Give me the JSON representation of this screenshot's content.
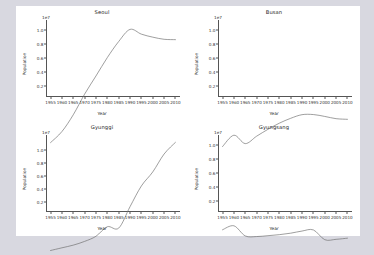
{
  "figure": {
    "background": "#d8d8e0",
    "axes_background": "#ffffff",
    "line_color": "#6b6b6b"
  },
  "chart_data": [
    {
      "type": "line",
      "title": "Seoul",
      "xlabel": "Year",
      "ylabel": "Population",
      "offset_text": "1e7",
      "grid": false,
      "legend": "none",
      "xlim": [
        1953,
        2012
      ],
      "ylim": [
        0.05,
        1.12
      ],
      "xticks": [
        1955,
        1960,
        1965,
        1970,
        1975,
        1980,
        1985,
        1990,
        1995,
        2000,
        2005,
        2010
      ],
      "yticks": [
        0.2,
        0.4,
        0.6,
        0.8,
        1.0
      ],
      "ytick_labels": [
        "0.2",
        "0.4",
        "0.6",
        "0.8",
        "1.0"
      ],
      "x": [
        1955,
        1960,
        1965,
        1970,
        1975,
        1980,
        1985,
        1990,
        1995,
        2000,
        2005,
        2010
      ],
      "values": [
        0.157,
        0.245,
        0.379,
        0.544,
        0.689,
        0.836,
        0.964,
        1.061,
        1.023,
        0.999,
        0.982,
        0.979
      ]
    },
    {
      "type": "line",
      "title": "Busan",
      "xlabel": "Year",
      "ylabel": "Population",
      "offset_text": "1e7",
      "grid": false,
      "legend": "none",
      "xlim": [
        1953,
        2012
      ],
      "ylim": [
        0.05,
        1.12
      ],
      "xticks": [
        1955,
        1960,
        1965,
        1970,
        1975,
        1980,
        1985,
        1990,
        1995,
        2000,
        2005,
        2010
      ],
      "yticks": [
        0.2,
        0.4,
        0.6,
        0.8,
        1.0
      ],
      "ytick_labels": [
        "0.2",
        "0.4",
        "0.6",
        "0.8",
        "1.0"
      ],
      "x": [
        1955,
        1960,
        1965,
        1970,
        1975,
        1980,
        1985,
        1990,
        1995,
        2000,
        2005,
        2010
      ],
      "values": [
        0.125,
        0.216,
        0.149,
        0.208,
        0.263,
        0.312,
        0.351,
        0.38,
        0.381,
        0.366,
        0.348,
        0.343
      ]
    },
    {
      "type": "line",
      "title": "Gyunggi",
      "xlabel": "Year",
      "ylabel": "Population",
      "offset_text": "1e7",
      "grid": false,
      "legend": "none",
      "xlim": [
        1953,
        2012
      ],
      "ylim": [
        0.05,
        1.2
      ],
      "xticks": [
        1955,
        1960,
        1965,
        1970,
        1975,
        1980,
        1985,
        1990,
        1995,
        2000,
        2005,
        2010
      ],
      "yticks": [
        0.2,
        0.4,
        0.6,
        0.8,
        1.0
      ],
      "ytick_labels": [
        "0.2",
        "0.4",
        "0.6",
        "0.8",
        "1.0"
      ],
      "x": [
        1955,
        1960,
        1965,
        1970,
        1975,
        1980,
        1985,
        1990,
        1995,
        2000,
        2005,
        2010
      ],
      "values": [
        0.226,
        0.249,
        0.272,
        0.304,
        0.348,
        0.43,
        0.418,
        0.602,
        0.78,
        0.9,
        1.054,
        1.154
      ]
    },
    {
      "type": "line",
      "title": "Gyungsang",
      "xlabel": "Year",
      "ylabel": "Population",
      "offset_text": "1e7",
      "grid": false,
      "legend": "none",
      "xlim": [
        1953,
        2012
      ],
      "ylim": [
        0.05,
        1.12
      ],
      "xticks": [
        1955,
        1960,
        1965,
        1970,
        1975,
        1980,
        1985,
        1990,
        1995,
        2000,
        2005,
        2010
      ],
      "yticks": [
        0.2,
        0.4,
        0.6,
        0.8,
        1.0
      ],
      "ytick_labels": [
        "0.2",
        "0.4",
        "0.6",
        "0.8",
        "1.0"
      ],
      "x": [
        1955,
        1960,
        1965,
        1970,
        1975,
        1980,
        1985,
        1990,
        1995,
        2000,
        2005,
        2010
      ],
      "values": [
        0.379,
        0.411,
        0.33,
        0.325,
        0.332,
        0.34,
        0.352,
        0.369,
        0.378,
        0.3,
        0.303,
        0.312
      ]
    }
  ]
}
